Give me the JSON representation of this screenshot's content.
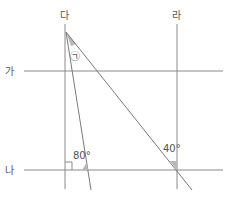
{
  "diagram": {
    "labels": {
      "line_ga": "가",
      "line_na": "나",
      "line_da": "다",
      "line_ra": "라",
      "angle_unknown": "㉠",
      "angle_80": "80°",
      "angle_40": "40°"
    },
    "colors": {
      "line": "#8a8a8a",
      "text": "#555555",
      "shade": "#b8b8b8"
    }
  }
}
